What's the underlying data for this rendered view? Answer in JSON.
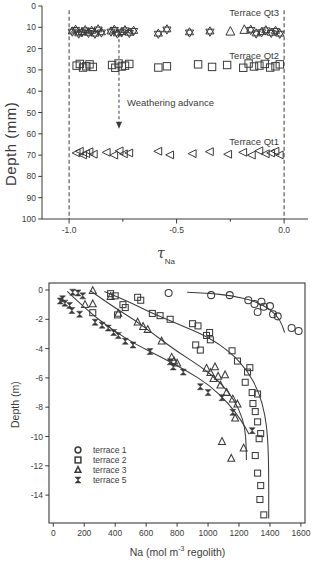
{
  "colors": {
    "ink": "#3b3b3b",
    "background": "#ffffff"
  },
  "chart_data": [
    {
      "type": "scatter",
      "name": "tau-depth-profile",
      "ylabel": "Depth (mm)",
      "xlabel": {
        "main": "τ",
        "sub": "Na"
      },
      "xlim": [
        -1.126,
        0.102
      ],
      "ylim": [
        0,
        100
      ],
      "grid": false,
      "xticks": {
        "major": [
          -1.0,
          -0.5,
          0.0
        ],
        "labels": [
          "-1.0",
          "-0.5",
          "0.0"
        ],
        "minor": [
          -0.75,
          -0.25
        ]
      },
      "yticks": [
        0,
        10,
        20,
        30,
        40,
        50,
        60,
        70,
        80,
        90,
        100
      ],
      "dashed_vlines": [
        -1.0,
        0.0
      ],
      "annotations": [
        {
          "text": "Terrace Qt3",
          "y_px": 7
        },
        {
          "text": "Terrace Qt2",
          "y_px": 50
        },
        {
          "text": "Terrace Qt1",
          "y_px": 136
        },
        {
          "text": "Weathering advance"
        }
      ],
      "arrow": {
        "x": -0.768,
        "y_from": 13,
        "y_to": 55
      },
      "series": [
        {
          "name": "Terrace Qt3",
          "marker": "star6",
          "depth": 12,
          "tau": [
            -0.985,
            -0.97,
            -0.955,
            -0.94,
            -0.925,
            -0.91,
            -0.895,
            -0.88,
            -0.865,
            -0.85,
            -0.805,
            -0.79,
            -0.775,
            -0.755,
            -0.74,
            -0.72,
            -0.7,
            -0.585,
            -0.545,
            -0.44,
            -0.345,
            -0.155,
            -0.13,
            -0.105,
            -0.085,
            -0.06,
            -0.04,
            -0.02
          ]
        },
        {
          "name": "Terrace Qt3 open triangles",
          "marker": "triangle-up",
          "depth": 12,
          "tau": [
            -0.25,
            -0.185
          ]
        },
        {
          "name": "Terrace Qt2",
          "marker": "square",
          "depth": 28,
          "tau": [
            -0.965,
            -0.95,
            -0.935,
            -0.92,
            -0.905,
            -0.89,
            -0.8,
            -0.785,
            -0.77,
            -0.755,
            -0.74,
            -0.72,
            -0.585,
            -0.545,
            -0.4,
            -0.335,
            -0.265,
            -0.19,
            -0.165,
            -0.14,
            -0.115,
            -0.09,
            -0.065,
            -0.04,
            -0.02
          ]
        },
        {
          "name": "Terrace Qt1",
          "marker": "triangle-left",
          "depth": 69,
          "tau": [
            -0.965,
            -0.95,
            -0.935,
            -0.92,
            -0.905,
            -0.885,
            -0.825,
            -0.79,
            -0.765,
            -0.745,
            -0.72,
            -0.585,
            -0.53,
            -0.425,
            -0.345,
            -0.26,
            -0.19,
            -0.15,
            -0.115,
            -0.085,
            -0.06,
            -0.04,
            -0.02
          ]
        }
      ]
    },
    {
      "type": "scatter",
      "name": "na-depth-profile",
      "ylabel": "Depth (m)",
      "xlabel_parts": {
        "pre": "Na (mol m",
        "sup": "-3",
        "post": " regolith)"
      },
      "xlim": [
        0,
        1600
      ],
      "ylim": [
        0,
        -15.9
      ],
      "grid": false,
      "xticks": [
        0,
        200,
        400,
        600,
        800,
        1000,
        1200,
        1400,
        1600
      ],
      "yticks": [
        0,
        -2,
        -4,
        -6,
        -8,
        -10,
        -12,
        -14
      ],
      "legend": [
        {
          "label": "terrace 1",
          "marker": "circle"
        },
        {
          "label": "terrace 2",
          "marker": "square"
        },
        {
          "label": "terrace 3",
          "marker": "triangle-up"
        },
        {
          "label": "terrace 5",
          "marker": "hourglass"
        }
      ],
      "series": [
        {
          "name": "terrace 1",
          "marker": "circle",
          "points": [
            [
              745,
              -0.2
            ],
            [
              1020,
              -0.35
            ],
            [
              1140,
              -0.35
            ],
            [
              1260,
              -0.7
            ],
            [
              1300,
              -0.95
            ],
            [
              1345,
              -0.8
            ],
            [
              1360,
              -1.15
            ],
            [
              1400,
              -1.1
            ],
            [
              1320,
              -1.5
            ],
            [
              1420,
              -1.65
            ],
            [
              1450,
              -1.8
            ],
            [
              1540,
              -2.6
            ],
            [
              1585,
              -2.8
            ]
          ],
          "curve": [
            [
              865,
              -0.15
            ],
            [
              1000,
              -0.22
            ],
            [
              1150,
              -0.38
            ],
            [
              1300,
              -0.75
            ],
            [
              1400,
              -1.3
            ],
            [
              1465,
              -2.0
            ],
            [
              1495,
              -2.9
            ]
          ]
        },
        {
          "name": "terrace 2",
          "marker": "square",
          "points": [
            [
              370,
              -0.25
            ],
            [
              400,
              -0.4
            ],
            [
              545,
              -0.5
            ],
            [
              565,
              -0.7
            ],
            [
              450,
              -1.0
            ],
            [
              465,
              -1.2
            ],
            [
              255,
              -1.55
            ],
            [
              415,
              -1.7
            ],
            [
              640,
              -1.6
            ],
            [
              690,
              -1.75
            ],
            [
              755,
              -2.0
            ],
            [
              900,
              -2.3
            ],
            [
              935,
              -2.45
            ],
            [
              1010,
              -2.9
            ],
            [
              990,
              -3.1
            ],
            [
              1015,
              -3.4
            ],
            [
              920,
              -3.75
            ],
            [
              950,
              -4.1
            ],
            [
              1155,
              -4.15
            ],
            [
              1190,
              -4.85
            ],
            [
              1270,
              -5.3
            ],
            [
              1255,
              -5.6
            ],
            [
              1240,
              -6.3
            ],
            [
              1285,
              -7.0
            ],
            [
              1320,
              -7.1
            ],
            [
              1290,
              -7.75
            ],
            [
              1305,
              -8.3
            ],
            [
              1320,
              -9.0
            ],
            [
              1340,
              -9.8
            ],
            [
              1330,
              -10.15
            ],
            [
              1305,
              -11.3
            ],
            [
              1320,
              -12.5
            ],
            [
              1340,
              -13.35
            ],
            [
              1335,
              -14.3
            ],
            [
              1360,
              -15.35
            ]
          ],
          "curve": [
            [
              330,
              -0.1
            ],
            [
              480,
              -0.75
            ],
            [
              620,
              -1.5
            ],
            [
              800,
              -2.3
            ],
            [
              1000,
              -3.2
            ],
            [
              1150,
              -4.3
            ],
            [
              1255,
              -5.5
            ],
            [
              1330,
              -7.0
            ],
            [
              1368,
              -8.5
            ],
            [
              1385,
              -10.0
            ],
            [
              1392,
              -12.0
            ],
            [
              1392,
              -15.6
            ]
          ]
        },
        {
          "name": "terrace 3",
          "marker": "triangle-up",
          "points": [
            [
              255,
              -0.05
            ],
            [
              205,
              -1.0
            ],
            [
              255,
              -0.95
            ],
            [
              370,
              -0.45
            ],
            [
              420,
              -1.6
            ],
            [
              545,
              -2.2
            ],
            [
              580,
              -2.5
            ],
            [
              610,
              -2.7
            ],
            [
              700,
              -3.5
            ],
            [
              765,
              -4.6
            ],
            [
              780,
              -4.85
            ],
            [
              800,
              -5.0
            ],
            [
              990,
              -5.35
            ],
            [
              1045,
              -5.25
            ],
            [
              1015,
              -5.65
            ],
            [
              1065,
              -5.9
            ],
            [
              1110,
              -5.8
            ],
            [
              1035,
              -6.05
            ],
            [
              1080,
              -6.5
            ],
            [
              1120,
              -7.0
            ],
            [
              1160,
              -7.45
            ],
            [
              1190,
              -7.8
            ],
            [
              1175,
              -8.75
            ],
            [
              1090,
              -10.35
            ],
            [
              1230,
              -10.8
            ],
            [
              1150,
              -11.5
            ]
          ],
          "curve": [
            [
              240,
              -0.05
            ],
            [
              380,
              -1.1
            ],
            [
              520,
              -2.0
            ],
            [
              660,
              -3.1
            ],
            [
              800,
              -4.2
            ],
            [
              950,
              -5.2
            ],
            [
              1080,
              -6.3
            ],
            [
              1170,
              -7.5
            ],
            [
              1225,
              -8.8
            ],
            [
              1245,
              -10.0
            ],
            [
              1248,
              -11.6
            ]
          ]
        },
        {
          "name": "terrace 5",
          "marker": "hourglass",
          "points": [
            [
              125,
              -0.15
            ],
            [
              160,
              -0.2
            ],
            [
              60,
              -0.6
            ],
            [
              190,
              -0.4
            ],
            [
              75,
              -0.9
            ],
            [
              105,
              -1.05
            ],
            [
              45,
              -0.75
            ],
            [
              120,
              -1.4
            ],
            [
              170,
              -1.65
            ],
            [
              270,
              -2.2
            ],
            [
              315,
              -2.4
            ],
            [
              355,
              -2.6
            ],
            [
              390,
              -2.9
            ],
            [
              420,
              -3.1
            ],
            [
              465,
              -3.5
            ],
            [
              515,
              -3.75
            ],
            [
              625,
              -4.2
            ],
            [
              755,
              -4.9
            ],
            [
              775,
              -5.25
            ],
            [
              840,
              -5.6
            ],
            [
              950,
              -6.6
            ],
            [
              1000,
              -7.0
            ],
            [
              1090,
              -7.35
            ],
            [
              1160,
              -8.35
            ],
            [
              1285,
              -9.6
            ]
          ],
          "curve": [
            [
              90,
              -0.1
            ],
            [
              230,
              -1.5
            ],
            [
              380,
              -2.7
            ],
            [
              530,
              -3.7
            ],
            [
              700,
              -4.6
            ],
            [
              860,
              -5.5
            ],
            [
              1010,
              -6.5
            ],
            [
              1130,
              -7.7
            ],
            [
              1215,
              -8.9
            ],
            [
              1265,
              -9.85
            ]
          ]
        }
      ]
    }
  ]
}
